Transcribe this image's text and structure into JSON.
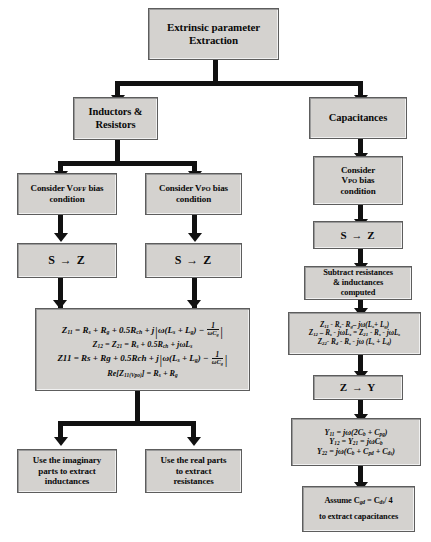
{
  "diagram": {
    "nodes": {
      "root": {
        "line1": "Extrinsic parameter",
        "line2": "Extraction"
      },
      "inductors_resistors": {
        "line1": "Inductors &",
        "line2": "Resistors"
      },
      "capacitances": {
        "line1": "Capacitances"
      },
      "consider_voff": {
        "line1": "Consider V",
        "sub1": "OFF",
        "line1b": " bias",
        "line2": "condition"
      },
      "consider_vpo_left": {
        "line1": "Consider V",
        "sub1": "PO",
        "line1b": " bias",
        "line2": "condition"
      },
      "consider_vpo_right": {
        "line1": "Consider",
        "line2": "V",
        "sub2": "PO",
        "line2b": " bias",
        "line3": "condition"
      },
      "s_to_z_left": {
        "label": "S → Z"
      },
      "s_to_z_right": {
        "label": "S → Z"
      },
      "s_to_z_cap": {
        "label": "S → Z"
      },
      "z_to_y": {
        "label": "Z → Y"
      },
      "subtract": {
        "line1": "Subtract resistances",
        "line2": "& inductances",
        "line3": "computed"
      },
      "use_imaginary": {
        "line1": "Use the imaginary",
        "line2": "parts to extract",
        "line3": "inductances"
      },
      "use_real": {
        "line1": "Use the real parts",
        "line2": "to extract",
        "line3": "resistances"
      },
      "assume": {
        "line1": "Assume C",
        "sub1": "gd",
        "line1b": " = C",
        "sub2": "ds",
        "line1c": "/ 4",
        "line2": "to extract capacitances"
      }
    },
    "equations": {
      "z_main": {
        "line1_lhs": "Z",
        "line1_lhs_sub": "11",
        "line1": " = R",
        "line1_sub1": "s",
        "line1b": " + R",
        "line1_sub2": "g",
        "line1c": " + 0.5R",
        "line1_sub3": "ch",
        "line1d": " + j",
        "line1_brk_open": "|",
        "line1_inner": "ω(L",
        "line1_sub4": "s",
        "line1_inner_b": " + L",
        "line1_sub5": "g",
        "line1_inner_c": ") − ",
        "line1_frac_num": "1",
        "line1_frac_den": "ωC",
        "line1_frac_den_sub": "g",
        "line1_brk_close": "|",
        "line2": "Z₁₂ = Z₂₁ = Rₛ + 0.5Rᴄₕ + jωLₛ",
        "line2_parts": {
          "lhs1": "Z",
          "lhs1_sub": "12",
          "eq1": " = Z",
          "lhs2_sub": "21",
          "rhs": " = R",
          "rhs_sub1": "s",
          "rhs_b": " + 0.5R",
          "rhs_sub2": "ch",
          "rhs_c": " + jωL",
          "rhs_sub3": "s"
        },
        "line3_parts": {
          "lhs": "Z11 = Rs + Rg + 0.5Rch + j",
          "brk_open": "|",
          "inner_a": "ω(L",
          "sub1": "s",
          "inner_b": " + L",
          "sub2": "g",
          "inner_c": ") − ",
          "frac_num": "1",
          "frac_den": "ωC",
          "frac_den_sub": "g",
          "brk_close": "|"
        },
        "line4_parts": {
          "pre": "Re[Z",
          "sub1": "11(Vpo)",
          "post": "] = R",
          "sub2": "s",
          "post_b": " + R",
          "sub3": "g"
        }
      },
      "z_subtract": {
        "line1_parts": {
          "a": "Z",
          "a_sub": "11",
          "b": " - R",
          "b_sub": "s",
          "c": "- R",
          "c_sub": "g",
          "d": "– jω(L",
          "d_sub": "s",
          "e": "+ L",
          "e_sub": "g",
          "f": ")"
        },
        "line2_parts": {
          "a": "Z",
          "a_sub": "12",
          "b": " – R",
          "b_sub": "s",
          "c": " - jωL",
          "c_sub": "s",
          "d": " = Z",
          "d_sub": "21",
          "e": " - R",
          "e_sub": "s",
          "f": " - jωL",
          "f_sub": "s"
        },
        "line3_parts": {
          "a": "Z",
          "a_sub": "22",
          "b": "- R",
          "b_sub": "d",
          "c": " - R",
          "c_sub": "s",
          "d": " - jω (L",
          "d_sub": "s",
          "e": " + L",
          "e_sub": "d",
          "f": ")"
        }
      },
      "y_equations": {
        "line1_parts": {
          "a": "Y",
          "a_sub": "11",
          "b": " = jω(2C",
          "b_sub": "b",
          "c": " + C",
          "c_sub": "pg",
          "d": ")"
        },
        "line2_parts": {
          "a": "Y",
          "a_sub": "12",
          "b": " = Y",
          "b_sub": "21",
          "c": " = jωC",
          "c_sub": "b"
        },
        "line3_parts": {
          "a": "Y",
          "a_sub": "22",
          "b": " = jω(C",
          "b_sub": "b",
          "c": " + C",
          "c_sub": "pd",
          "d": " + C",
          "d_sub": "ds",
          "e": ")"
        }
      }
    },
    "colors": {
      "box_fill": "#d4d2cf",
      "box_border": "#5d5d5d",
      "connector": "#111111",
      "text": "#0a0a0a",
      "background": "#ffffff"
    }
  }
}
